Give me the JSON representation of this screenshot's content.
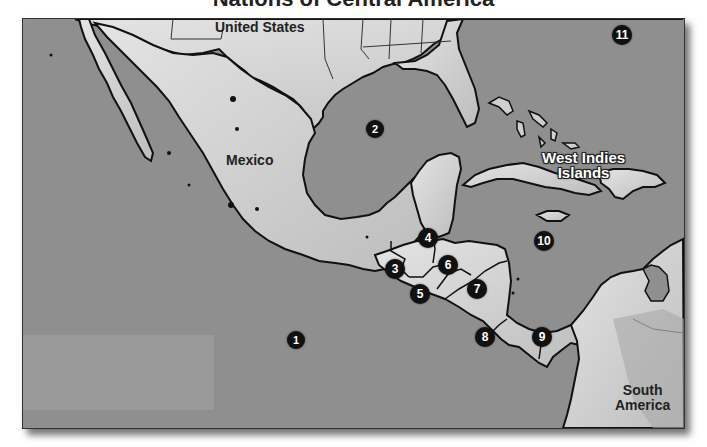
{
  "title": "Nations of Central America",
  "colors": {
    "water": "#8e8e8e",
    "land": "#cfcfcf",
    "land_highlight": "#e8e8e8",
    "border": "#111111",
    "marker_fill": "#111111",
    "marker_text": "#ffffff"
  },
  "labels": {
    "united_states": "United States",
    "mexico": "Mexico",
    "west_indies": "West Indies Islands",
    "west_indies_line1": "West Indies",
    "west_indies_line2": "Islands",
    "south_america_line1": "South",
    "south_america_line2": "America"
  },
  "markers": [
    {
      "id": "1",
      "x": 295,
      "y": 339
    },
    {
      "id": "2",
      "x": 374,
      "y": 128
    },
    {
      "id": "3",
      "x": 394,
      "y": 268
    },
    {
      "id": "4",
      "x": 427,
      "y": 237
    },
    {
      "id": "5",
      "x": 419,
      "y": 293
    },
    {
      "id": "6",
      "x": 447,
      "y": 264
    },
    {
      "id": "7",
      "x": 476,
      "y": 288
    },
    {
      "id": "8",
      "x": 484,
      "y": 336
    },
    {
      "id": "9",
      "x": 541,
      "y": 336
    },
    {
      "id": "10",
      "x": 543,
      "y": 240
    },
    {
      "id": "11",
      "x": 621,
      "y": 34
    }
  ]
}
